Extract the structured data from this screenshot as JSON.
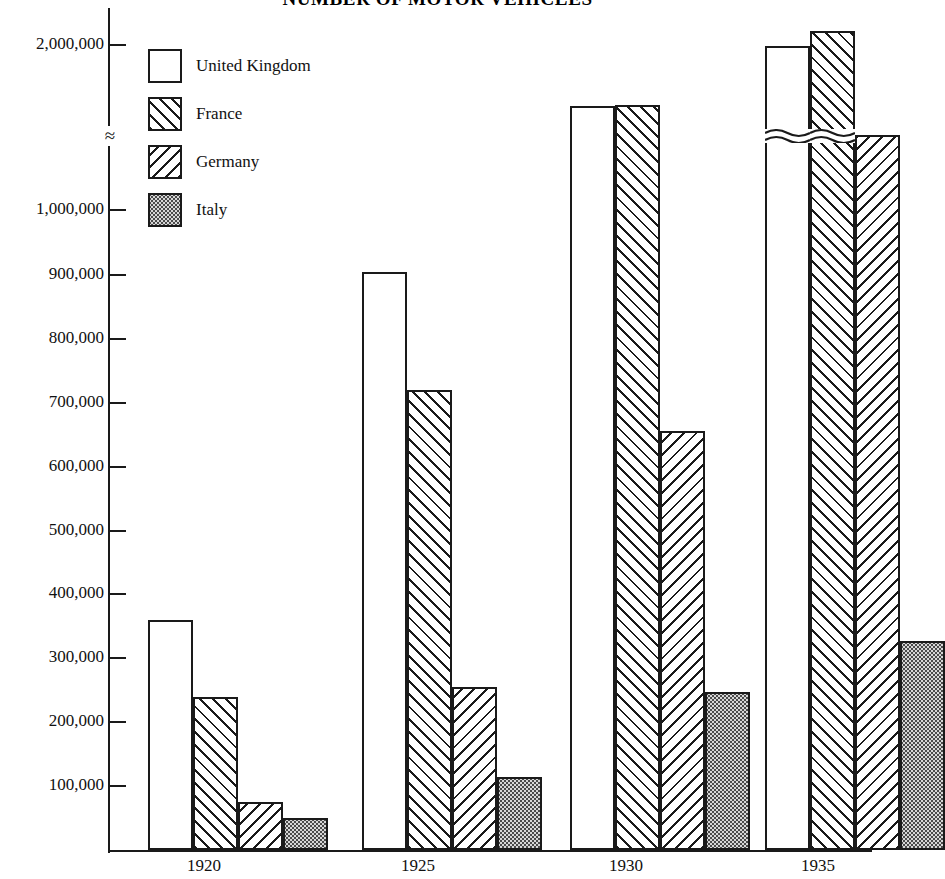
{
  "chart_data": {
    "type": "bar",
    "title": "NUMBER OF MOTOR VEHICLES",
    "xlabel": "",
    "ylabel": "",
    "categories": [
      "1920",
      "1925",
      "1930",
      "1935"
    ],
    "series": [
      {
        "name": "United Kingdom",
        "pattern": "solid-white",
        "values": [
          360000,
          905000,
          1330000,
          1990000
        ]
      },
      {
        "name": "France",
        "pattern": "diagonal-right",
        "values": [
          240000,
          720000,
          1345000,
          2150000
        ]
      },
      {
        "name": "Germany",
        "pattern": "diagonal-left",
        "values": [
          75000,
          255000,
          655000,
          1015000
        ]
      },
      {
        "name": "Italy",
        "pattern": "dotted",
        "values": [
          50000,
          115000,
          248000,
          327000
        ]
      }
    ],
    "ylim": [
      0,
      2000000
    ],
    "y_ticks": [
      "100,000",
      "200,000",
      "300,000",
      "400,000",
      "500,000",
      "600,000",
      "700,000",
      "800,000",
      "900,000",
      "1,000,000",
      "2,000,000"
    ],
    "axis_break": {
      "present": true,
      "symbol": "≈",
      "between": [
        "1,000,000",
        "2,000,000"
      ]
    },
    "grid": false,
    "legend_position": "upper-left-inside"
  },
  "legend": {
    "items": [
      {
        "label": "United Kingdom",
        "pattern": "solid-white"
      },
      {
        "label": "France",
        "pattern": "diagonal-right"
      },
      {
        "label": "Germany",
        "pattern": "diagonal-left"
      },
      {
        "label": "Italy",
        "pattern": "dotted"
      }
    ]
  },
  "colors": {
    "ink": "#1a1a1a",
    "paper": "#ffffff",
    "italy_fill": "#d6d6d6"
  }
}
